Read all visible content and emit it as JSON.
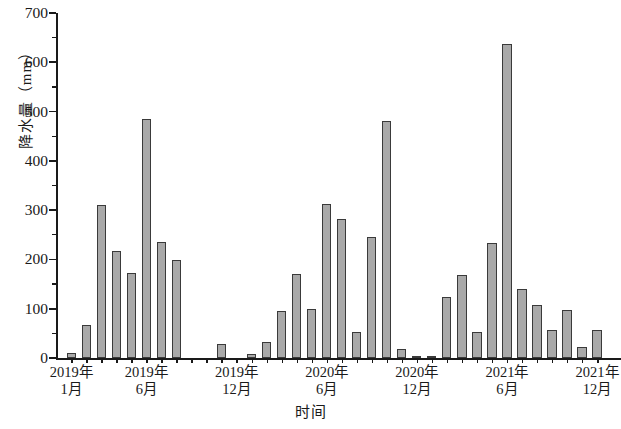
{
  "chart_data": {
    "type": "bar",
    "title": "",
    "xlabel": "时间",
    "ylabel": "降水量（mm）",
    "ylim": [
      0,
      700
    ],
    "ytick_major": [
      0,
      100,
      200,
      300,
      400,
      500,
      600,
      700
    ],
    "ytick_minor": [
      50,
      150,
      250,
      350,
      450,
      550,
      650
    ],
    "grid": false,
    "legend": "none",
    "bar_color": "#a9a9a9",
    "bar_edge_color": "#3a3a3a",
    "axis_color": "#1a1a1a",
    "xtick_labels": [
      {
        "line1": "2019年",
        "line2": "1月"
      },
      {
        "line1": "2019年",
        "line2": "6月"
      },
      {
        "line1": "2019年",
        "line2": "12月"
      },
      {
        "line1": "2020年",
        "line2": "6月"
      },
      {
        "line1": "2020年",
        "line2": "12月"
      },
      {
        "line1": "2021年",
        "line2": "6月"
      },
      {
        "line1": "2021年",
        "line2": "12月"
      }
    ],
    "categories": [
      "2019-01",
      "2019-02",
      "2019-03",
      "2019-04",
      "2019-05",
      "2019-06",
      "2019-07",
      "2019-08",
      "2019-09",
      "2019-10",
      "2019-11",
      "2019-12",
      "2020-01",
      "2020-02",
      "2020-03",
      "2020-04",
      "2020-05",
      "2020-06",
      "2020-07",
      "2020-08",
      "2020-09",
      "2020-10",
      "2020-11",
      "2020-12",
      "2021-01",
      "2021-02",
      "2021-03",
      "2021-04",
      "2021-05",
      "2021-06",
      "2021-07",
      "2021-08",
      "2021-09",
      "2021-10",
      "2021-11",
      "2021-12"
    ],
    "values": [
      10,
      68,
      310,
      218,
      172,
      485,
      235,
      198,
      0,
      0,
      28,
      0,
      8,
      33,
      95,
      170,
      100,
      313,
      282,
      53,
      246,
      480,
      18,
      5,
      4,
      123,
      168,
      52,
      233,
      637,
      140,
      108,
      56,
      98,
      22,
      57
    ]
  }
}
